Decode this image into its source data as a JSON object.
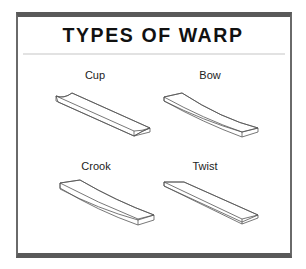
{
  "title": "TYPES OF WARP",
  "panels": [
    {
      "label": "Cup",
      "icon": "cup-warp-board-icon"
    },
    {
      "label": "Bow",
      "icon": "bow-warp-board-icon"
    },
    {
      "label": "Crook",
      "icon": "crook-warp-board-icon"
    },
    {
      "label": "Twist",
      "icon": "twist-warp-board-icon"
    }
  ],
  "colors": {
    "frame": "#595959",
    "rule": "#e2e2e2",
    "text": "#111111",
    "stroke": "#555555"
  }
}
